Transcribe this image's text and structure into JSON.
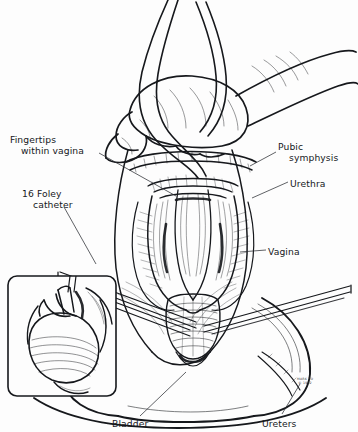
{
  "figure": {
    "style": "pen-and-ink medical illustration",
    "background_color": "#fdfdfd",
    "ink_color": "#16181c"
  },
  "labels": {
    "fingertips": {
      "line1": "Fingertips",
      "line2": "within vagina"
    },
    "foley": {
      "line1": "16 Foley",
      "line2": "catheter"
    },
    "pubic": {
      "line1": "Pubic",
      "line2": "symphysis"
    },
    "urethra": {
      "text": "Urethra"
    },
    "vagina": {
      "text": "Vagina"
    },
    "bladder": {
      "text": "Bladder"
    },
    "ureters": {
      "text": "Ureters"
    }
  },
  "signature": {
    "line1": "MARK TO",
    "line2": "© 1992"
  }
}
